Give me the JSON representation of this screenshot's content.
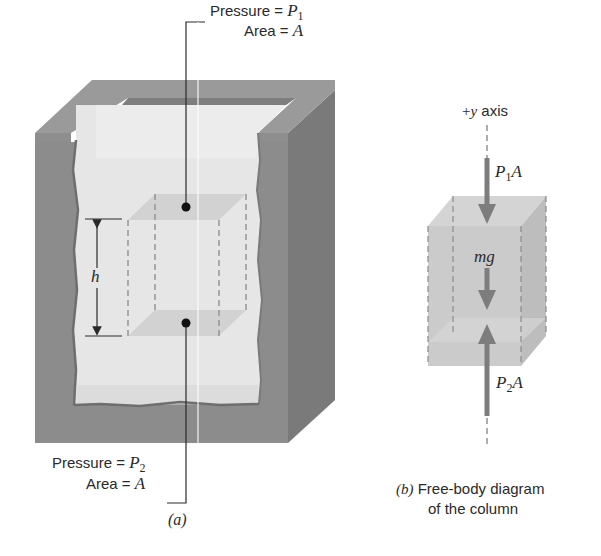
{
  "figure": {
    "panel_a": {
      "top_label": {
        "pressure_text": "Pressure = ",
        "pressure_var": "P",
        "pressure_sub": "1",
        "area_text": "Area = ",
        "area_var": "A"
      },
      "bottom_label": {
        "pressure_text": "Pressure = ",
        "pressure_var": "P",
        "pressure_sub": "2",
        "area_text": "Area = ",
        "area_var": "A"
      },
      "height_label": "h",
      "caption": "(a)"
    },
    "panel_b": {
      "axis_label_prefix": "+",
      "axis_label_var": "y",
      "axis_label_suffix": " axis",
      "force_top": {
        "var": "P",
        "sub": "1",
        "suffix": "A"
      },
      "force_weight": "mg",
      "force_bottom": {
        "var": "P",
        "sub": "2",
        "suffix": "A"
      },
      "caption_letter": "(b)",
      "caption_line1": "Free-body diagram",
      "caption_line2": "of the column"
    },
    "colors": {
      "tank_front": "#8c8c8c",
      "tank_side": "#7a7a7a",
      "tank_rim": "#9a9a9a",
      "fluid": "#e4e4e4",
      "column_face": "#c9c9c9",
      "arrow": "#7d7d7d",
      "text": "#2a2a2a"
    }
  }
}
